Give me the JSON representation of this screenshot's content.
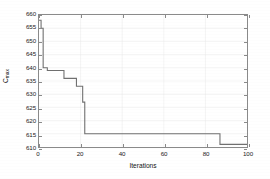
{
  "chart_data": {
    "type": "line",
    "title": "",
    "xlabel": "Iterations",
    "ylabel": "C",
    "ylabel_sub": "max",
    "xlim": [
      0,
      100
    ],
    "ylim": [
      610,
      660
    ],
    "grid": true,
    "legend": null,
    "x_ticks": [
      0,
      20,
      40,
      60,
      80,
      100
    ],
    "x_tick_labels": [
      "0",
      "20",
      "40",
      "60",
      "80",
      "100"
    ],
    "y_ticks": [
      610,
      615,
      620,
      625,
      630,
      635,
      640,
      645,
      650,
      655,
      660
    ],
    "y_tick_labels": [
      "610",
      "615",
      "620",
      "625",
      "630",
      "635",
      "640",
      "645",
      "650",
      "655",
      "660"
    ],
    "series": [
      {
        "name": "C_max convergence",
        "color": "#707070",
        "linewidth": 1.1,
        "step": "post",
        "x": [
          0,
          1,
          2,
          4,
          8,
          12,
          15,
          18,
          20,
          21,
          22,
          86,
          87,
          100
        ],
        "y": [
          658,
          655,
          640,
          639,
          639,
          636,
          636,
          633,
          633,
          627,
          615,
          615,
          611,
          611
        ]
      }
    ],
    "annotations": []
  },
  "figure": {
    "background_color": "#ffffff",
    "axis_color": "#8a8a8a",
    "grid_color": "#e8e8e8",
    "text_color": "#1a1a1a"
  }
}
